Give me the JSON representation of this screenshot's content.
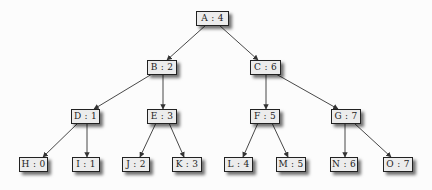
{
  "diagram": {
    "type": "binary-tree",
    "colors": {
      "node_fill": "#ececec",
      "node_border": "#222222",
      "edge": "#333333",
      "background": "#fcfcfc"
    },
    "nodes": {
      "A": {
        "label": "A : 4",
        "key": "A",
        "value": 4
      },
      "B": {
        "label": "B : 2",
        "key": "B",
        "value": 2
      },
      "C": {
        "label": "C : 6",
        "key": "C",
        "value": 6
      },
      "D": {
        "label": "D : 1",
        "key": "D",
        "value": 1
      },
      "E": {
        "label": "E : 3",
        "key": "E",
        "value": 3
      },
      "F": {
        "label": "F : 5",
        "key": "F",
        "value": 5
      },
      "G": {
        "label": "G : 7",
        "key": "G",
        "value": 7
      },
      "H": {
        "label": "H : 0",
        "key": "H",
        "value": 0
      },
      "I": {
        "label": "I : 1",
        "key": "I",
        "value": 1
      },
      "J": {
        "label": "J : 2",
        "key": "J",
        "value": 2
      },
      "K": {
        "label": "K : 3",
        "key": "K",
        "value": 3
      },
      "L": {
        "label": "L : 4",
        "key": "L",
        "value": 4
      },
      "M": {
        "label": "M : 5",
        "key": "M",
        "value": 5
      },
      "N": {
        "label": "N : 6",
        "key": "N",
        "value": 6
      },
      "O": {
        "label": "O : 7",
        "key": "O",
        "value": 7
      }
    },
    "edges": [
      [
        "A",
        "B"
      ],
      [
        "A",
        "C"
      ],
      [
        "B",
        "D"
      ],
      [
        "B",
        "E"
      ],
      [
        "C",
        "F"
      ],
      [
        "C",
        "G"
      ],
      [
        "D",
        "H"
      ],
      [
        "D",
        "I"
      ],
      [
        "E",
        "J"
      ],
      [
        "E",
        "K"
      ],
      [
        "F",
        "L"
      ],
      [
        "F",
        "M"
      ],
      [
        "G",
        "N"
      ],
      [
        "G",
        "O"
      ]
    ]
  }
}
